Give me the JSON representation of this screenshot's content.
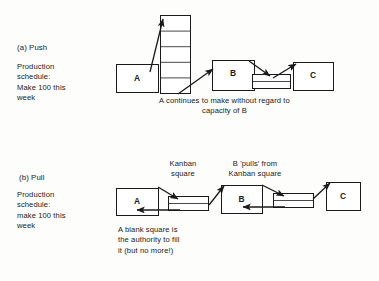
{
  "figure": {
    "background_color": "#fdfdfb",
    "stroke_color": "#1a1a1a",
    "box_fill": "#ffffff"
  },
  "push": {
    "section_label": "(a) Push",
    "schedule_text": "Production\nschedule:\nMake 100 this\nweek",
    "caption": "A continues to make without regard to\ncapacity of B",
    "boxes": [
      {
        "label": "A",
        "x": 116,
        "y": 64,
        "w": 42,
        "h": 28
      },
      {
        "label": "B",
        "x": 212,
        "y": 60,
        "w": 42,
        "h": 30
      },
      {
        "label": "C",
        "x": 293,
        "y": 62,
        "w": 40,
        "h": 28
      }
    ],
    "wip_stacks": [
      {
        "name": "tall-wip-stack",
        "x": 160,
        "y": 15,
        "w": 30,
        "h": 78,
        "rows": 5
      },
      {
        "name": "short-wip-stack",
        "x": 252,
        "y": 74,
        "w": 38,
        "h": 14,
        "rows": 2
      }
    ]
  },
  "pull": {
    "section_label": "(b) Pull",
    "schedule_text": "Production\nschedule:\nmake 100 this\nweek",
    "caption": "A blank square is\nthe authority to fill\nit (but no more!)",
    "kanban_label": "Kanban\nsquare",
    "pulls_label": "B 'pulls' from\nKanban square",
    "boxes": [
      {
        "label": "A",
        "x": 116,
        "y": 188,
        "w": 42,
        "h": 27
      },
      {
        "label": "B",
        "x": 221,
        "y": 185,
        "w": 41,
        "h": 28
      },
      {
        "label": "C",
        "x": 326,
        "y": 182,
        "w": 34,
        "h": 28
      }
    ],
    "kanban_squares": [
      {
        "name": "kanban-square-a",
        "x": 168,
        "y": 196,
        "w": 40,
        "h": 14,
        "rows": 2
      },
      {
        "name": "kanban-square-b",
        "x": 273,
        "y": 193,
        "w": 40,
        "h": 14,
        "rows": 2
      }
    ]
  }
}
